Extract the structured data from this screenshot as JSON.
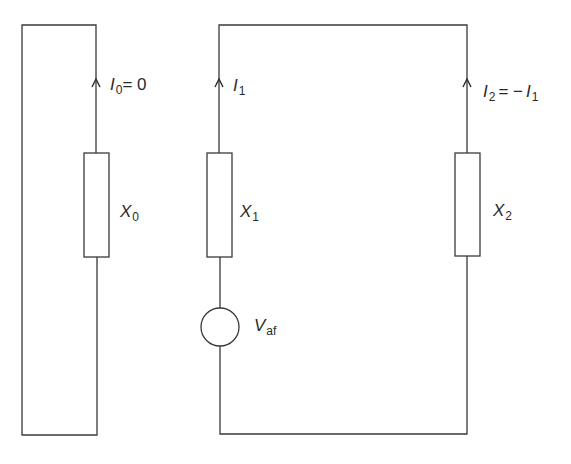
{
  "diagram": {
    "type": "equivalent-circuit",
    "colors": {
      "line": "#3a3a3a",
      "text": "#2a2a2a",
      "background": "#ffffff"
    },
    "zero_sequence_loop": {
      "current_label": {
        "symbol": "I",
        "sub": "0",
        "rest": "= 0"
      },
      "impedance_label": {
        "symbol": "X",
        "sub": "0"
      }
    },
    "main_loop": {
      "branch1": {
        "current_label": {
          "symbol": "I",
          "sub": "1"
        },
        "impedance_label": {
          "symbol": "X",
          "sub": "1"
        },
        "source_label": {
          "symbol": "V",
          "sub": "af"
        }
      },
      "branch2": {
        "current_label": {
          "symbol": "I",
          "sub": "2",
          "rest": "= −",
          "symbol2": "I",
          "sub2": "1"
        },
        "impedance_label": {
          "symbol": "X",
          "sub": "2"
        }
      }
    }
  }
}
